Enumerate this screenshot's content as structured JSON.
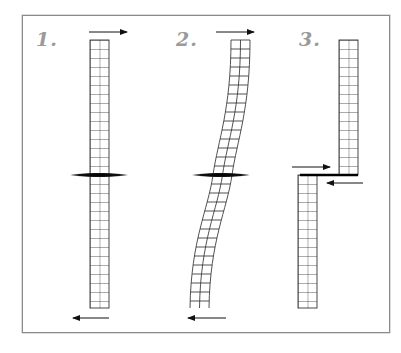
{
  "figure": {
    "panels": [
      {
        "number": "1.",
        "description": "Vertical strip (2 cells wide) intact across a fault; shear arrows: top pointing right, bottom pointing left"
      },
      {
        "number": "2.",
        "description": "Strip deformed into an S-curve by elastic strain across the fault"
      },
      {
        "number": "3.",
        "description": "Strip ruptured and offset along the fault; arrows indicate opposing slip"
      }
    ],
    "colors": {
      "line": "#222222",
      "fault": "#000000",
      "label": "#9a9a9a",
      "frame": "#8a8a8a"
    }
  }
}
